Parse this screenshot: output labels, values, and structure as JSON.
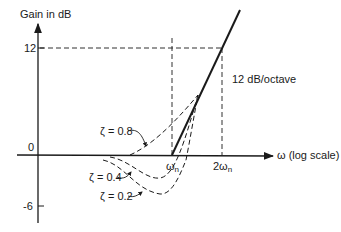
{
  "diagram": {
    "y_axis": {
      "label": "Gain in dB",
      "ticks": [
        {
          "value": 12,
          "label": "12"
        },
        {
          "value": 0,
          "label": "0"
        },
        {
          "value": -6,
          "label": "-6"
        }
      ]
    },
    "x_axis": {
      "label": "ω (log scale)",
      "ticks": [
        {
          "label": "ωn",
          "base": "ω",
          "sub": "n"
        },
        {
          "label": "2ωn",
          "base": "2ω",
          "sub": "n"
        }
      ]
    },
    "asymptote_label": "12 dB/octave",
    "curves": [
      {
        "zeta": "ζ = 0.8"
      },
      {
        "zeta": "ζ = 0.4"
      },
      {
        "zeta": "ζ = 0.2"
      }
    ],
    "colors": {
      "ink": "#1a1a1a",
      "background": "#ffffff"
    }
  }
}
